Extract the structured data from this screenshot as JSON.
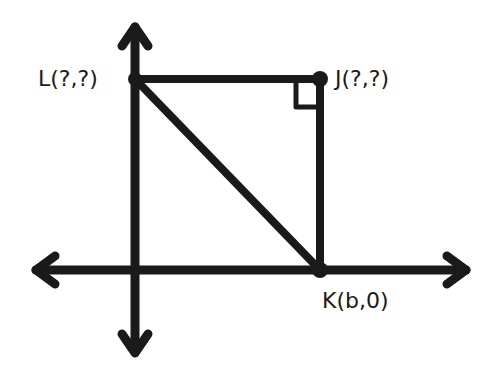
{
  "diagram": {
    "type": "coordinate-geometry",
    "points": {
      "L": {
        "label": "L(?,?)",
        "x": 135,
        "y": 79
      },
      "J": {
        "label": "J(?,?)",
        "x": 320,
        "y": 79
      },
      "K": {
        "label": "K(b,0)",
        "x": 320,
        "y": 270
      }
    },
    "segments": [
      [
        "L",
        "J"
      ],
      [
        "J",
        "K"
      ],
      [
        "L",
        "K"
      ]
    ],
    "right_angle_at": "J",
    "axes": {
      "x_axis_y": 270,
      "y_axis_x": 135
    },
    "stroke_color": "#1a1a1a"
  }
}
